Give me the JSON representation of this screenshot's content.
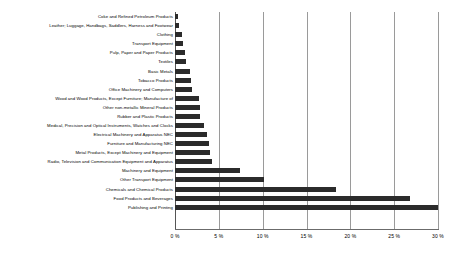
{
  "chart_data": {
    "type": "bar",
    "orientation": "horizontal",
    "title": "",
    "subtitle": "",
    "xlabel": "",
    "ylabel": "",
    "xlim": [
      0,
      30
    ],
    "ylim": null,
    "grid": "vertical",
    "legend": null,
    "legend_position": "none",
    "bar_color": "#2b2b2b",
    "axis_color": "#6b6b6b",
    "gridline_color": "#9a9a9a",
    "x_tick_labels": [
      "0 %",
      "5 %",
      "10 %",
      "15 %",
      "20 %",
      "25 %",
      "30 %"
    ],
    "x_tick_values": [
      0,
      5,
      10,
      15,
      20,
      25,
      30
    ],
    "categories": [
      "Coke and Refined Petroleum Products",
      "Leather; Luggage, Handbags, Saddlers, Harness and Footwear",
      "Clothing",
      "Transport Equipment",
      "Pulp, Paper and Paper Products",
      "Textiles",
      "Basic Metals",
      "Tobacco Products",
      "Office Machinery and Computers",
      "Wood and Wood Products, Except Furniture; Manufacture of",
      "Other non-metallic Mineral Products",
      "Rubber and Plastic Products",
      "Medical, Precision and Optical Instruments, Watches and Clocks",
      "Electrical Machinery and Apparatus NEC",
      "Furniture and Manufacturing NEC",
      "Metal Products, Except Machinery and Equipment",
      "Radio, Television and Communication Equipment and Apparatus",
      "Machinery and Equipment",
      "Other Transport Equipment",
      "Chemicals and Chemical Products",
      "Food Products and Beverages",
      "Publishing and Printing"
    ],
    "values": [
      0.3,
      0.4,
      0.8,
      0.9,
      1.1,
      1.2,
      1.7,
      1.8,
      1.9,
      2.7,
      2.8,
      2.9,
      3.3,
      3.6,
      3.9,
      4.0,
      4.2,
      7.4,
      10.2,
      18.4,
      26.8,
      30.0
    ]
  }
}
